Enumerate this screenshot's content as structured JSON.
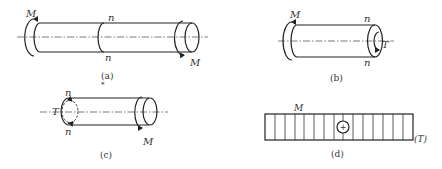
{
  "figures": [
    {
      "id": "a",
      "caption": "(a)",
      "labels": {
        "moment_left": "M",
        "moment_right": "M",
        "section_top": "n",
        "section_bottom": "n"
      }
    },
    {
      "id": "b",
      "caption": "(b)",
      "labels": {
        "moment_left": "M",
        "torque_right": "T",
        "section_top": "n",
        "section_bottom": "n"
      }
    },
    {
      "id": "c",
      "caption": "(c)",
      "labels": {
        "torque_left": "T",
        "moment_right": "M",
        "section_top": "n",
        "section_bottom": "n"
      }
    },
    {
      "id": "d",
      "caption": "(d)",
      "labels": {
        "moment": "M",
        "sign": "+",
        "axis_label": "(T)"
      },
      "diagram_type": "torque diagram",
      "divisions": 15
    }
  ],
  "stray_mark": "*",
  "colors": {
    "line": "#222222",
    "background": "#ffffff"
  }
}
